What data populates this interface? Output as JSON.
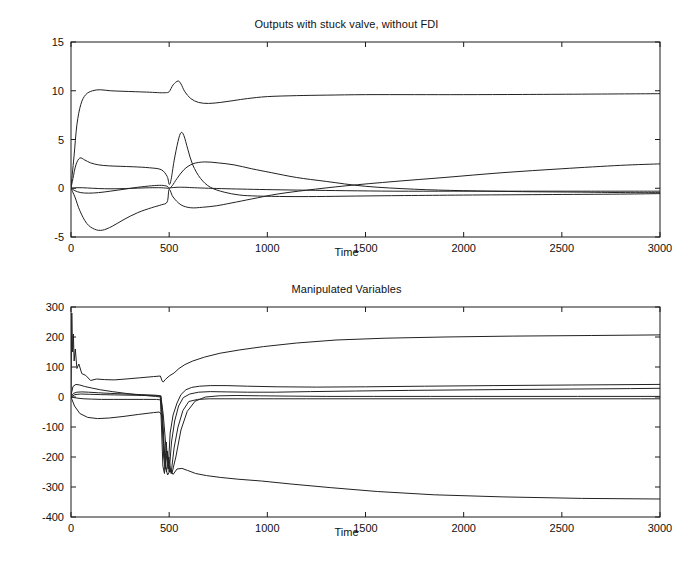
{
  "figure": {
    "width": 693,
    "height": 578,
    "background": "#ffffff",
    "line_color": "#222222",
    "axis_color": "#1b1b1b"
  },
  "panels": {
    "top": {
      "title": "Outputs with stuck valve, without FDI",
      "xlabel": "Time"
    },
    "bottom": {
      "title": "Manipulated Variables",
      "xlabel": "Time"
    }
  },
  "chart_data": [
    {
      "type": "line",
      "title": "Outputs with stuck valve, without FDI",
      "xlabel": "Time",
      "ylabel": "",
      "xlim": [
        0,
        3000
      ],
      "ylim": [
        -5,
        15
      ],
      "xticks": [
        0,
        500,
        1000,
        1500,
        2000,
        2500,
        3000
      ],
      "xticklabels": [
        "0",
        "500",
        "1000",
        "1500",
        "2000",
        "2500",
        "3000"
      ],
      "yticks": [
        -5,
        0,
        5,
        10,
        15
      ],
      "yticklabels": [
        "-5",
        "0",
        "5",
        "10",
        "15"
      ],
      "grid": false,
      "legend": null,
      "series": [
        {
          "name": "output-1",
          "x": [
            0,
            15,
            30,
            50,
            75,
            110,
            150,
            200,
            260,
            330,
            400,
            450,
            480,
            500,
            520,
            545,
            560,
            580,
            610,
            650,
            700,
            760,
            830,
            900,
            1000,
            1150,
            1300,
            1500,
            1750,
            2000,
            2300,
            2600,
            3000
          ],
          "y": [
            0.1,
            3.2,
            6.5,
            8.6,
            9.6,
            10.0,
            10.1,
            10.0,
            9.95,
            9.9,
            9.85,
            9.8,
            9.8,
            9.9,
            10.6,
            11.0,
            10.7,
            9.9,
            9.2,
            8.8,
            8.7,
            8.8,
            9.0,
            9.2,
            9.4,
            9.5,
            9.55,
            9.6,
            9.6,
            9.6,
            9.62,
            9.65,
            9.7
          ]
        },
        {
          "name": "output-2",
          "x": [
            0,
            10,
            25,
            45,
            70,
            100,
            140,
            190,
            250,
            320,
            400,
            460,
            490,
            500,
            510,
            525,
            545,
            560,
            575,
            595,
            620,
            660,
            710,
            780,
            860,
            950,
            1100,
            1250,
            1450,
            1700,
            2000,
            2400,
            2800,
            3000
          ],
          "y": [
            0.05,
            1.0,
            2.4,
            3.1,
            2.9,
            2.6,
            2.4,
            2.3,
            2.25,
            2.2,
            2.1,
            1.9,
            1.2,
            0.4,
            0.9,
            2.8,
            4.8,
            5.7,
            5.4,
            4.0,
            2.4,
            1.0,
            0.1,
            -0.4,
            -0.7,
            -0.8,
            -0.85,
            -0.85,
            -0.8,
            -0.75,
            -0.7,
            -0.65,
            -0.6,
            -0.55
          ]
        },
        {
          "name": "output-3",
          "x": [
            0,
            20,
            50,
            90,
            140,
            200,
            270,
            340,
            410,
            460,
            490,
            500,
            515,
            540,
            575,
            620,
            680,
            750,
            830,
            920,
            1020,
            1150,
            1300,
            1500,
            1750,
            2000,
            2300,
            2600,
            2850,
            3000
          ],
          "y": [
            0.0,
            -0.25,
            -0.45,
            -0.5,
            -0.45,
            -0.3,
            -0.1,
            0.1,
            0.25,
            0.3,
            0.2,
            0.0,
            0.25,
            1.0,
            1.9,
            2.5,
            2.7,
            2.6,
            2.4,
            2.0,
            1.6,
            1.1,
            0.7,
            0.2,
            -0.1,
            -0.25,
            -0.35,
            -0.4,
            -0.45,
            -0.45
          ]
        },
        {
          "name": "output-4",
          "x": [
            0,
            20,
            45,
            80,
            120,
            160,
            210,
            270,
            340,
            410,
            460,
            490,
            500,
            520,
            560,
            610,
            670,
            740,
            820,
            920,
            1050,
            1200,
            1400,
            1650,
            1900,
            2200,
            2500,
            2800,
            3000
          ],
          "y": [
            0.0,
            -0.9,
            -2.3,
            -3.6,
            -4.2,
            -4.3,
            -3.9,
            -3.2,
            -2.5,
            -2.0,
            -1.7,
            -1.4,
            -0.1,
            -0.9,
            -1.7,
            -2.0,
            -1.95,
            -1.8,
            -1.5,
            -1.1,
            -0.6,
            -0.2,
            0.25,
            0.7,
            1.1,
            1.6,
            2.0,
            2.35,
            2.5
          ]
        },
        {
          "name": "output-5",
          "x": [
            0,
            25,
            60,
            110,
            170,
            240,
            320,
            400,
            460,
            495,
            510,
            540,
            580,
            630,
            700,
            790,
            900,
            1030,
            1200,
            1400,
            1650,
            1950,
            2300,
            2650,
            3000
          ],
          "y": [
            0.0,
            0.05,
            0.05,
            0.0,
            -0.05,
            -0.05,
            0.0,
            0.05,
            0.05,
            0.0,
            0.05,
            0.1,
            0.1,
            0.05,
            0.0,
            -0.05,
            -0.1,
            -0.15,
            -0.2,
            -0.25,
            -0.3,
            -0.3,
            -0.3,
            -0.3,
            -0.3
          ]
        }
      ]
    },
    {
      "type": "line",
      "title": "Manipulated Variables",
      "xlabel": "Time",
      "ylabel": "",
      "xlim": [
        0,
        3000
      ],
      "ylim": [
        -400,
        300
      ],
      "xticks": [
        0,
        500,
        1000,
        1500,
        2000,
        2500,
        3000
      ],
      "xticklabels": [
        "0",
        "500",
        "1000",
        "1500",
        "2000",
        "2500",
        "3000"
      ],
      "yticks": [
        -400,
        -300,
        -200,
        -100,
        0,
        100,
        200,
        300
      ],
      "yticklabels": [
        "-400",
        "-300",
        "-200",
        "-100",
        "0",
        "100",
        "200",
        "300"
      ],
      "grid": false,
      "legend": null,
      "series": [
        {
          "name": "mv-1",
          "x": [
            0,
            4,
            8,
            12,
            16,
            22,
            30,
            40,
            55,
            75,
            100,
            130,
            170,
            220,
            280,
            350,
            420,
            455,
            465,
            470,
            480,
            500,
            525,
            550,
            580,
            620,
            680,
            760,
            860,
            980,
            1150,
            1350,
            1600,
            1900,
            2250,
            2650,
            3000
          ],
          "y": [
            0,
            280,
            150,
            210,
            120,
            160,
            95,
            110,
            78,
            72,
            55,
            60,
            58,
            57,
            60,
            64,
            68,
            70,
            52,
            50,
            58,
            70,
            80,
            95,
            108,
            120,
            133,
            146,
            157,
            168,
            180,
            190,
            196,
            200,
            203,
            205,
            207
          ]
        },
        {
          "name": "mv-2",
          "x": [
            0,
            10,
            25,
            45,
            70,
            105,
            150,
            210,
            280,
            360,
            430,
            455,
            462,
            468,
            476,
            485,
            495,
            505,
            520,
            540,
            560,
            585,
            615,
            655,
            710,
            790,
            900,
            1050,
            1250,
            1500,
            1800,
            2150,
            2550,
            3000
          ],
          "y": [
            5,
            35,
            42,
            40,
            35,
            30,
            24,
            18,
            12,
            6,
            2,
            0,
            -120,
            -230,
            -255,
            -150,
            -240,
            -120,
            -60,
            -20,
            8,
            24,
            32,
            36,
            38,
            38,
            36,
            34,
            33,
            34,
            36,
            38,
            40,
            42
          ]
        },
        {
          "name": "mv-3",
          "x": [
            0,
            12,
            30,
            55,
            90,
            140,
            200,
            280,
            360,
            430,
            458,
            465,
            472,
            480,
            490,
            500,
            512,
            528,
            548,
            572,
            605,
            650,
            710,
            790,
            900,
            1040,
            1220,
            1450,
            1720,
            2050,
            2450,
            2850,
            3000
          ],
          "y": [
            0,
            12,
            16,
            17,
            16,
            14,
            12,
            10,
            8,
            6,
            4,
            -90,
            -200,
            -240,
            -180,
            -250,
            -150,
            -80,
            -30,
            -2,
            10,
            16,
            18,
            17,
            16,
            16,
            18,
            20,
            22,
            24,
            26,
            28,
            29
          ]
        },
        {
          "name": "mv-4",
          "x": [
            0,
            15,
            35,
            65,
            105,
            155,
            215,
            290,
            370,
            435,
            460,
            468,
            476,
            486,
            498,
            510,
            525,
            545,
            570,
            600,
            645,
            705,
            785,
            890,
            1030,
            1200,
            1420,
            1700,
            2050,
            2450,
            2900,
            3000
          ],
          "y": [
            0,
            -2,
            -4,
            -6,
            -7,
            -8,
            -8,
            -8,
            -8,
            -8,
            -10,
            -80,
            -180,
            -250,
            -200,
            -255,
            -170,
            -100,
            -45,
            -15,
            -8,
            -6,
            -6,
            -6,
            -6,
            -6,
            -6,
            -6,
            -6,
            -6,
            -6,
            -6
          ]
        },
        {
          "name": "mv-5",
          "x": [
            0,
            18,
            45,
            85,
            135,
            195,
            265,
            345,
            420,
            450,
            462,
            470,
            480,
            492,
            505,
            520,
            540,
            565,
            595,
            635,
            690,
            760,
            850,
            970,
            1120,
            1320,
            1560,
            1850,
            2200,
            2600,
            3000
          ],
          "y": [
            0,
            -30,
            -55,
            -68,
            -72,
            -70,
            -65,
            -58,
            -52,
            -50,
            -60,
            -140,
            -230,
            -260,
            -245,
            -258,
            -240,
            -238,
            -245,
            -255,
            -262,
            -268,
            -274,
            -280,
            -290,
            -302,
            -315,
            -326,
            -333,
            -338,
            -340
          ]
        },
        {
          "name": "mv-6",
          "x": [
            0,
            20,
            50,
            95,
            150,
            220,
            300,
            390,
            440,
            458,
            470,
            484,
            498,
            514,
            534,
            560,
            592,
            632,
            685,
            755,
            845,
            960,
            1110,
            1300,
            1540,
            1830,
            2180,
            2580,
            3000
          ],
          "y": [
            0,
            8,
            10,
            9,
            8,
            7,
            6,
            5,
            4,
            2,
            -60,
            -170,
            -235,
            -255,
            -200,
            -110,
            -48,
            -14,
            0,
            4,
            5,
            4,
            3,
            2,
            2,
            2,
            2,
            2,
            2
          ]
        }
      ]
    }
  ]
}
